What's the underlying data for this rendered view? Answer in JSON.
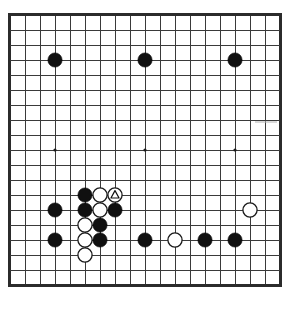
{
  "diagram": {
    "board_size": 19,
    "board_label": "19x19 Go board",
    "colors": {
      "background": "#ffffff",
      "grid": "#3a3a3a",
      "border": "#2b2b2b",
      "black_stone": "#101010",
      "white_stone": "#ffffff",
      "white_stone_outline": "#1a1a1a",
      "star_point": "#1c1c1c",
      "mark": "#101010"
    },
    "geometry": {
      "origin_x": 10,
      "origin_y": 15,
      "spacing": 15,
      "stone_radius": 7.1,
      "star_radius": 1.6,
      "lines": 19
    }
  },
  "star_points": [
    {
      "col": 3,
      "row": 3,
      "name": "star-point-upper-left"
    },
    {
      "col": 9,
      "row": 3,
      "name": "star-point-upper-center"
    },
    {
      "col": 15,
      "row": 3,
      "name": "star-point-upper-right"
    },
    {
      "col": 3,
      "row": 9,
      "name": "star-point-left-center"
    },
    {
      "col": 9,
      "row": 9,
      "name": "star-point-tengen"
    },
    {
      "col": 15,
      "row": 9,
      "name": "star-point-right-center"
    },
    {
      "col": 3,
      "row": 15,
      "name": "star-point-lower-left"
    },
    {
      "col": 9,
      "row": 15,
      "name": "star-point-lower-center"
    },
    {
      "col": 15,
      "row": 15,
      "name": "star-point-lower-right"
    }
  ],
  "stones": [
    {
      "col": 3,
      "row": 3,
      "color": "black",
      "label": "D16",
      "mark": null
    },
    {
      "col": 9,
      "row": 3,
      "color": "black",
      "label": "K16",
      "mark": null
    },
    {
      "col": 15,
      "row": 3,
      "color": "black",
      "label": "Q16",
      "mark": null
    },
    {
      "col": 5,
      "row": 12,
      "color": "black",
      "label": "F7",
      "mark": null
    },
    {
      "col": 6,
      "row": 12,
      "color": "white",
      "label": "G7",
      "mark": null
    },
    {
      "col": 7,
      "row": 12,
      "color": "white",
      "label": "H7",
      "mark": "triangle"
    },
    {
      "col": 3,
      "row": 13,
      "color": "black",
      "label": "D6",
      "mark": null
    },
    {
      "col": 5,
      "row": 13,
      "color": "black",
      "label": "F6",
      "mark": null
    },
    {
      "col": 6,
      "row": 13,
      "color": "white",
      "label": "G6",
      "mark": null
    },
    {
      "col": 7,
      "row": 13,
      "color": "black",
      "label": "H6",
      "mark": null
    },
    {
      "col": 16,
      "row": 13,
      "color": "white",
      "label": "R6",
      "mark": null
    },
    {
      "col": 5,
      "row": 14,
      "color": "white",
      "label": "F5",
      "mark": null
    },
    {
      "col": 6,
      "row": 14,
      "color": "black",
      "label": "G5",
      "mark": null
    },
    {
      "col": 3,
      "row": 15,
      "color": "black",
      "label": "D4",
      "mark": null
    },
    {
      "col": 5,
      "row": 15,
      "color": "white",
      "label": "F4",
      "mark": null
    },
    {
      "col": 6,
      "row": 15,
      "color": "black",
      "label": "G4",
      "mark": null
    },
    {
      "col": 9,
      "row": 15,
      "color": "black",
      "label": "K4",
      "mark": null
    },
    {
      "col": 11,
      "row": 15,
      "color": "white",
      "label": "M4",
      "mark": null
    },
    {
      "col": 13,
      "row": 15,
      "color": "black",
      "label": "O4",
      "mark": null
    },
    {
      "col": 15,
      "row": 15,
      "color": "black",
      "label": "Q4",
      "mark": null
    },
    {
      "col": 5,
      "row": 16,
      "color": "white",
      "label": "F3",
      "mark": null
    }
  ],
  "artifacts": [
    {
      "name": "scan-smudge-right",
      "x": 255,
      "y": 121,
      "width": 22,
      "height": 2
    }
  ]
}
